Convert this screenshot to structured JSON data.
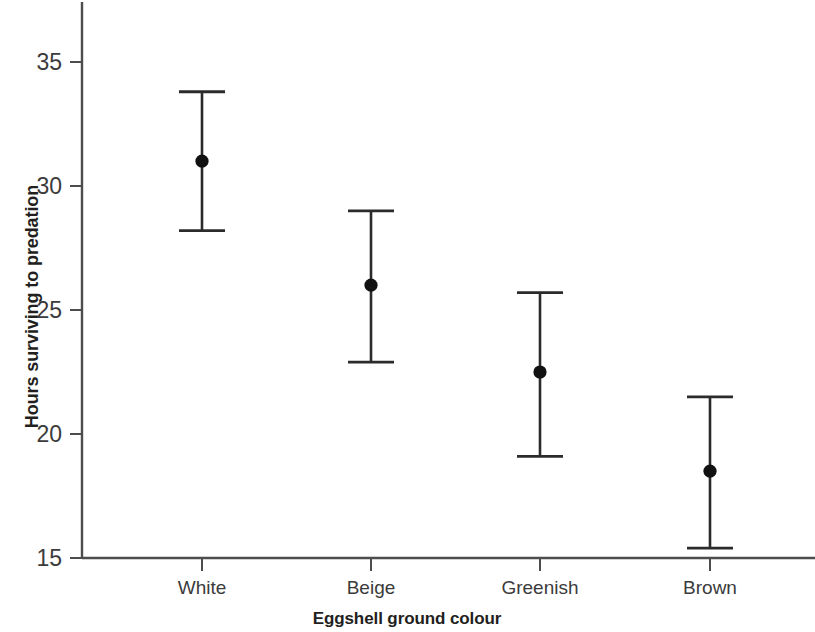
{
  "chart_data": {
    "type": "scatter",
    "title": "",
    "subtitle": "",
    "xlabel": "Eggshell ground colour",
    "ylabel": "Hours surviving to predation",
    "categories": [
      "White",
      "Beige",
      "Greenish",
      "Brown"
    ],
    "values": [
      31.0,
      26.0,
      22.5,
      18.5
    ],
    "error_low": [
      28.2,
      22.9,
      19.1,
      15.4
    ],
    "error_high": [
      33.8,
      29.0,
      25.7,
      21.5
    ],
    "series": [
      {
        "name": "Hours surviving to predation",
        "points": [
          {
            "category": "White",
            "value": 31.0,
            "low": 28.2,
            "high": 33.8
          },
          {
            "category": "Beige",
            "value": 26.0,
            "low": 22.9,
            "high": 29.0
          },
          {
            "category": "Greenish",
            "value": 22.5,
            "low": 19.1,
            "high": 25.7
          },
          {
            "category": "Brown",
            "value": 18.5,
            "low": 15.4,
            "high": 21.5
          }
        ]
      }
    ],
    "ylim": [
      15,
      36.6
    ],
    "yticks": [
      15,
      20,
      25,
      30,
      35
    ],
    "ytick_labels": [
      "15",
      "20",
      "25",
      "30",
      "35"
    ],
    "grid": false,
    "legend": false,
    "legend_position": "none",
    "error_bar_style": "capped-range",
    "marker": "filled-circle",
    "marker_color": "#111111",
    "axis_color": "#4d4d4d",
    "background_color": "#ffffff"
  },
  "axes": {
    "y_title": "Hours surviving to predation",
    "x_title": "Eggshell ground colour"
  }
}
